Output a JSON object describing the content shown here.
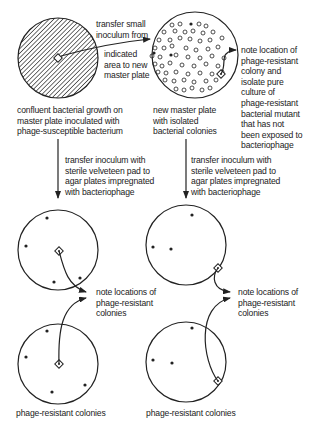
{
  "diagram": {
    "labels": {
      "transfer_small": "transfer small\ninoculum from",
      "indicated_area": "indicated\narea to new\nmaster plate",
      "confluent": "confluent bacterial growth on\nmaster plate inoculated with\nphage-susceptible bacterium",
      "new_master": "new master plate\nwith isolated\nbacterial colonies",
      "note_isolate": "note location of\nphage-resistant\ncolony and\nisolate pure\nculture of\nphage-resistant\nbacterial mutant\nthat has not\nbeen exposed to\nbacteriophage",
      "transfer_left": "transfer inoculum with\nsterile velveteen pad to\nagar plates impregnated\nwith bacteriophage",
      "transfer_right": "transfer inoculum with\nsterile velveteen pad to\nagar plates impregnated\nwith bacteriophage",
      "note_locations_left": "note locations of\nphage-resistant\ncolonies",
      "note_locations_right": "note locations of\nphage-resistant\ncolonies",
      "caption_left": "phage-resistant colonies",
      "caption_right": "phage-resistant colonies"
    },
    "plates": [
      {
        "id": "master-plate",
        "fill": "hatched"
      },
      {
        "id": "new-master-plate",
        "fill": "colonies"
      },
      {
        "id": "phage-plate-left-top",
        "fill": "sparse"
      },
      {
        "id": "phage-plate-left-bottom",
        "fill": "sparse"
      },
      {
        "id": "phage-plate-right-top",
        "fill": "sparse"
      },
      {
        "id": "phage-plate-right-bottom",
        "fill": "sparse"
      }
    ],
    "colors": {
      "line": "#222222",
      "background": "#ffffff"
    }
  }
}
